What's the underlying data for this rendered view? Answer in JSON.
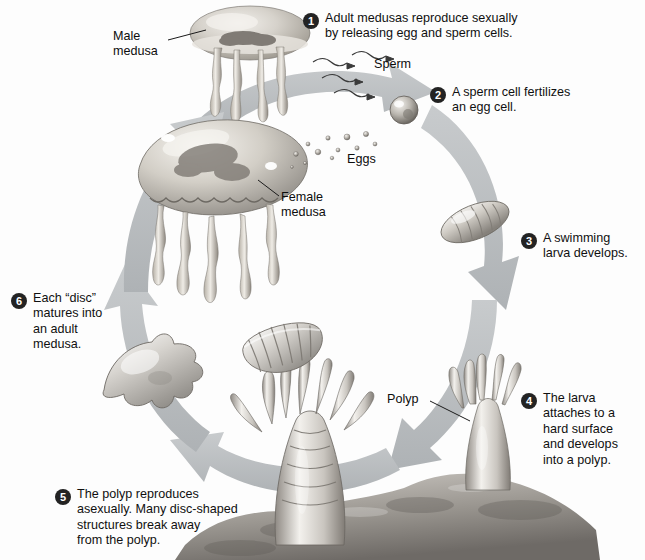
{
  "diagram": {
    "background_color": "#fdfdfd",
    "arrow_color": "#b9bcbe",
    "badge_color": "#232323",
    "text_color": "#101010"
  },
  "steps": [
    {
      "number": "1",
      "text": "Adult medusas reproduce sexually\nby releasing egg and sperm cells."
    },
    {
      "number": "2",
      "text": "A sperm cell fertilizes\nan egg cell."
    },
    {
      "number": "3",
      "text": "A swimming\nlarva develops."
    },
    {
      "number": "4",
      "text": "The larva\nattaches to a\nhard surface\nand develops\ninto a polyp."
    },
    {
      "number": "5",
      "text": "The polyp reproduces\nasexually. Many disc-shaped\nstructures break away\nfrom the polyp."
    },
    {
      "number": "6",
      "text": "Each “disc”\nmatures into\nan adult\nmedusa."
    }
  ],
  "labels": [
    {
      "name": "male-medusa",
      "text": "Male\nmedusa"
    },
    {
      "name": "sperm",
      "text": "Sperm"
    },
    {
      "name": "eggs",
      "text": "Eggs"
    },
    {
      "name": "female-medusa",
      "text": "Female\nmedusa"
    },
    {
      "name": "polyp",
      "text": "Polyp"
    }
  ],
  "organisms": [
    {
      "name": "male-medusa-illustration",
      "stage": "adult medusa (male)"
    },
    {
      "name": "female-medusa-illustration",
      "stage": "adult medusa (female)"
    },
    {
      "name": "egg-cluster-illustration",
      "stage": "eggs"
    },
    {
      "name": "fertilized-egg-illustration",
      "stage": "fertilized egg cell"
    },
    {
      "name": "larva-illustration",
      "stage": "swimming larva (planula)"
    },
    {
      "name": "polyp-attached-illustration",
      "stage": "polyp on hard surface"
    },
    {
      "name": "polyp-budding-illustration",
      "stage": "polyp producing discs"
    },
    {
      "name": "disc-stack-illustration",
      "stage": "disc-shaped structures"
    },
    {
      "name": "young-medusa-illustration",
      "stage": "young medusa disc"
    },
    {
      "name": "seafloor-rock-illustration",
      "stage": "hard surface / rock"
    }
  ]
}
